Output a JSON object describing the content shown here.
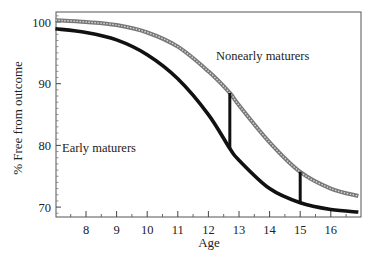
{
  "chart_data": {
    "type": "line",
    "title": "",
    "xlabel": "Age",
    "ylabel": "% Free from outcome",
    "xlim": [
      7.0,
      16.9
    ],
    "ylim": [
      68.5,
      101.5
    ],
    "xticks": [
      8,
      9,
      10,
      11,
      12,
      13,
      14,
      15,
      16
    ],
    "yticks": [
      70,
      80,
      90,
      100
    ],
    "grid": false,
    "legend": "inline labels",
    "series": [
      {
        "name": "Nonearly maturers",
        "style": "hollow-marker line (gray)",
        "color": "#8a8a8a",
        "x": [
          7.0,
          8,
          9,
          10,
          11,
          12,
          12.7,
          13,
          14,
          15,
          16,
          16.9
        ],
        "values": [
          100.3,
          100.0,
          99.5,
          98.3,
          96.0,
          92.0,
          88.5,
          86.5,
          80.5,
          75.7,
          73.0,
          71.8
        ]
      },
      {
        "name": "Early maturers",
        "style": "solid marker line (black)",
        "color": "#111111",
        "x": [
          7.0,
          8,
          9,
          10,
          11,
          12,
          12.7,
          13,
          14,
          15,
          16,
          16.9
        ],
        "values": [
          98.9,
          98.3,
          97.1,
          94.7,
          90.8,
          85.0,
          79.5,
          77.6,
          73.0,
          70.7,
          69.6,
          69.2
        ]
      }
    ],
    "annotations": [
      {
        "type": "vertical-segment",
        "x": 12.7,
        "y_from": 79.5,
        "y_to": 88.5
      },
      {
        "type": "vertical-segment",
        "x": 15.0,
        "y_from": 70.7,
        "y_to": 75.7
      },
      {
        "type": "label",
        "text": "Nonearly maturers",
        "x": 13.4,
        "y": 94.5
      },
      {
        "type": "label",
        "text": "Early maturers",
        "x": 7.2,
        "y": 79.8
      }
    ]
  },
  "labels": {
    "xlabel": "Age",
    "ylabel": "% Free from outcome",
    "series_nonearly": "Nonearly maturers",
    "series_early": "Early maturers"
  }
}
